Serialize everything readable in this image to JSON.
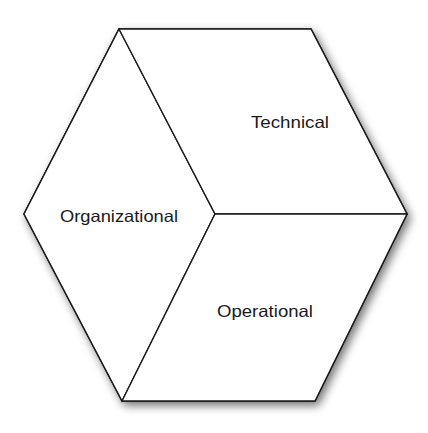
{
  "diagram": {
    "type": "cube",
    "faces": [
      {
        "id": "organizational",
        "label": "Organizational"
      },
      {
        "id": "technical",
        "label": "Technical"
      },
      {
        "id": "operational",
        "label": "Operational"
      }
    ],
    "colors": {
      "fill": "#ffffff",
      "stroke": "#1a1a1a",
      "shadow": "#8c8c8c",
      "text": "#1a1a1a"
    }
  }
}
